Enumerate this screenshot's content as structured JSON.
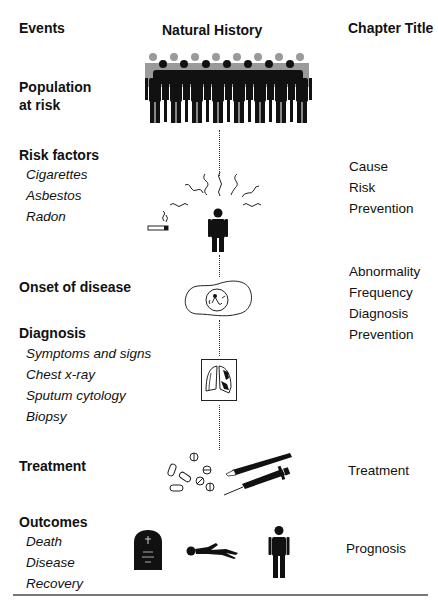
{
  "headers": {
    "events": "Events",
    "natural_history": "Natural History",
    "chapter_title": "Chapter Title"
  },
  "stages": [
    {
      "event": "Population\nat risk",
      "event_line1": "Population",
      "event_line2": "at risk",
      "items": [],
      "illustration": "crowd-of-people-icon",
      "chapters": []
    },
    {
      "event": "Risk factors",
      "items": [
        "Cigarettes",
        "Asbestos",
        "Radon"
      ],
      "illustration": "person-exposed-to-risks-icon",
      "chapters": [
        "Cause",
        "Risk",
        "Prevention"
      ]
    },
    {
      "event": "Onset of disease",
      "items": [],
      "illustration": "abnormal-cell-icon",
      "chapters": [
        "Abnormality",
        "Frequency",
        "Diagnosis",
        "Prevention"
      ]
    },
    {
      "event": "Diagnosis",
      "items": [
        "Symptoms and signs",
        "Chest x-ray",
        "Sputum cytology",
        "Biopsy"
      ],
      "illustration": "chest-xray-icon",
      "chapters": []
    },
    {
      "event": "Treatment",
      "items": [],
      "illustration": "pills-and-syringe-icon",
      "chapters": [
        "Treatment"
      ]
    },
    {
      "event": "Outcomes",
      "items": [
        "Death",
        "Disease",
        "Recovery"
      ],
      "illustration": "tombstone-lying-person-standing-person-icons",
      "chapters": [
        "Prognosis"
      ]
    }
  ],
  "colors": {
    "ink": "#111111",
    "back_row_gray": "#9a9a9a",
    "rule": "#777777"
  }
}
